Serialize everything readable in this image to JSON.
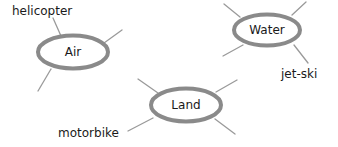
{
  "diagram": {
    "type": "mind-map",
    "colors": {
      "node_stroke": "#8a8a8a",
      "branch": "#9a9a9a",
      "text": "#1a1a1a"
    },
    "nodes": [
      {
        "id": "air",
        "label": "Air",
        "branch_label": "helicopter"
      },
      {
        "id": "water",
        "label": "Water",
        "branch_label": "jet-ski"
      },
      {
        "id": "land",
        "label": "Land",
        "branch_label": "motorbike"
      }
    ]
  }
}
